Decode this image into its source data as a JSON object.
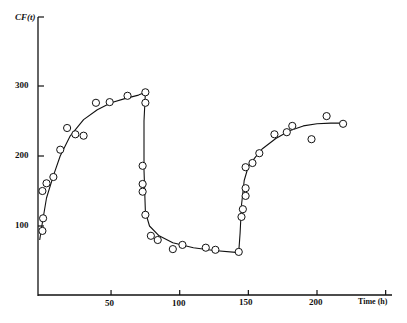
{
  "chart_data": {
    "type": "scatter",
    "title": "",
    "xlabel": "Time (h)",
    "ylabel": "CF(t)",
    "xlim": [
      -3,
      250
    ],
    "ylim": [
      0,
      400
    ],
    "x_ticks": [
      50,
      100,
      150,
      200
    ],
    "x_tick_labels": [
      "50",
      "100",
      "150",
      "200"
    ],
    "y_ticks": [
      100,
      200,
      300
    ],
    "y_tick_labels": [
      "100",
      "200",
      "300"
    ],
    "grid": false,
    "legend": null,
    "series": [
      {
        "name": "observed",
        "marker": "open-circle",
        "x": [
          0,
          0.5,
          0,
          3,
          8,
          13,
          18,
          24,
          30,
          39,
          49,
          62,
          75,
          75,
          73,
          73,
          73,
          75,
          79,
          84,
          95,
          102,
          119,
          126,
          143,
          145,
          146,
          148,
          148,
          148,
          153,
          158,
          169,
          178,
          182,
          196,
          207,
          219
        ],
        "y": [
          93,
          111,
          150,
          161,
          170,
          209,
          240,
          231,
          229,
          276,
          277,
          286,
          291,
          276,
          186,
          160,
          149,
          116,
          86,
          80,
          67,
          73,
          69,
          66,
          63,
          113,
          124,
          143,
          154,
          184,
          190,
          204,
          231,
          234,
          243,
          224,
          257,
          246
        ]
      },
      {
        "name": "fitted curve",
        "marker": "line",
        "x": [
          -2,
          0,
          3,
          8,
          13,
          20,
          30,
          40,
          50,
          60,
          70,
          75,
          74,
          74,
          75,
          78,
          85,
          95,
          110,
          125,
          143,
          144,
          145,
          147,
          150,
          155,
          160,
          170,
          180,
          190,
          200,
          210,
          219
        ],
        "y": [
          80,
          105,
          140,
          172,
          200,
          228,
          252,
          266,
          276,
          282,
          287,
          291,
          250,
          180,
          120,
          100,
          86,
          76,
          69,
          65,
          62,
          90,
          130,
          165,
          185,
          198,
          210,
          225,
          236,
          243,
          246,
          247,
          247
        ]
      }
    ]
  },
  "axes": {
    "ylabel": "CF(t)",
    "xlabel": "Time (h)",
    "yticks": [
      "300",
      "200",
      "100"
    ],
    "xticks": [
      "50",
      "100",
      "150",
      "200"
    ]
  }
}
